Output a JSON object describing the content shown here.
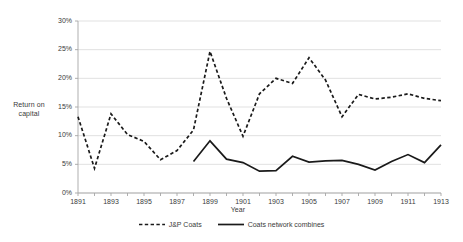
{
  "chart_data": {
    "type": "line",
    "title": "",
    "xlabel": "Year",
    "ylabel": "Return on capital",
    "xlim": [
      1891,
      1913
    ],
    "ylim": [
      0,
      30
    ],
    "ytick_labels": [
      "0%",
      "5%",
      "10%",
      "15%",
      "20%",
      "25%",
      "30%"
    ],
    "ytick_values": [
      0,
      5,
      10,
      15,
      20,
      25,
      30
    ],
    "xtick_labels": [
      "1891",
      "1893",
      "1895",
      "1897",
      "1899",
      "1901",
      "1903",
      "1905",
      "1907",
      "1909",
      "1911",
      "1913"
    ],
    "xtick_values": [
      1891,
      1893,
      1895,
      1897,
      1899,
      1901,
      1903,
      1905,
      1907,
      1909,
      1911,
      1913
    ],
    "grid": "horizontal",
    "legend_position": "bottom",
    "x": [
      1891,
      1892,
      1893,
      1894,
      1895,
      1896,
      1897,
      1898,
      1899,
      1900,
      1901,
      1902,
      1903,
      1904,
      1905,
      1906,
      1907,
      1908,
      1909,
      1910,
      1911,
      1912,
      1913
    ],
    "series": [
      {
        "name": "J&P Coats",
        "style": "dashed",
        "color": "#1a1a1a",
        "x": [
          1891,
          1892,
          1893,
          1894,
          1895,
          1896,
          1897,
          1898,
          1899,
          1900,
          1901,
          1902,
          1903,
          1904,
          1905,
          1906,
          1907,
          1908,
          1909,
          1910,
          1911,
          1912,
          1913
        ],
        "values": [
          13.3,
          4.3,
          13.8,
          10.2,
          9.0,
          5.8,
          7.4,
          11.0,
          24.7,
          16.5,
          9.9,
          17.3,
          20.0,
          19.1,
          23.6,
          19.7,
          13.3,
          17.2,
          16.4,
          16.7,
          17.3,
          16.5,
          16.1
        ]
      },
      {
        "name": "Coats network combines",
        "style": "solid",
        "color": "#1a1a1a",
        "x": [
          1898,
          1899,
          1900,
          1901,
          1902,
          1903,
          1904,
          1905,
          1906,
          1907,
          1908,
          1909,
          1910,
          1911,
          1912,
          1913
        ],
        "values": [
          5.5,
          9.1,
          5.9,
          5.3,
          3.8,
          3.9,
          6.4,
          5.4,
          5.6,
          5.7,
          5.0,
          4.0,
          5.5,
          6.7,
          5.3,
          8.4
        ]
      }
    ]
  },
  "legend": {
    "entries": [
      {
        "label": "J&P Coats",
        "style": "dashed"
      },
      {
        "label": "Coats network combines",
        "style": "solid"
      }
    ]
  },
  "colors": {
    "line": "#1a1a1a",
    "grid": "#d9d9d9",
    "axis": "#a6a6a6",
    "text": "#3a3a3a",
    "background": "#ffffff"
  }
}
